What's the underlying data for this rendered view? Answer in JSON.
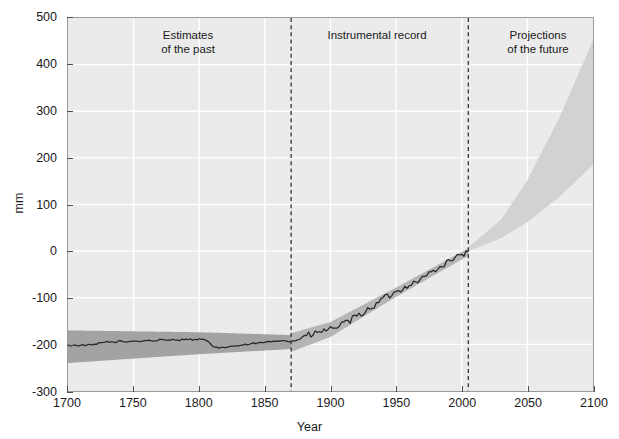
{
  "chart_data": {
    "type": "line",
    "title": "",
    "xlabel": "Year",
    "ylabel": "mm",
    "xlim": [
      1700,
      2100
    ],
    "ylim": [
      -300,
      500
    ],
    "xticks": [
      1700,
      1750,
      1800,
      1850,
      1900,
      1950,
      2000,
      2050,
      2100
    ],
    "yticks": [
      -300,
      -200,
      -100,
      0,
      100,
      200,
      300,
      400,
      500
    ],
    "grid": true,
    "legend_position": "none",
    "annotations": [
      {
        "text": "Estimates\nof the past",
        "x": 1785,
        "y": 455
      },
      {
        "text": "Instrumental record",
        "x": 1928,
        "y": 455
      },
      {
        "text": "Projections\nof the future",
        "x": 2058,
        "y": 455
      }
    ],
    "vertical_dividers": [
      {
        "x": 1870,
        "style": "dashed"
      },
      {
        "x": 2005,
        "style": "dashed"
      }
    ],
    "series": [
      {
        "name": "Reconstructed and observed sea level",
        "color": "#262626",
        "x": [
          1700,
          1710,
          1720,
          1725,
          1730,
          1735,
          1740,
          1745,
          1750,
          1755,
          1760,
          1765,
          1770,
          1775,
          1780,
          1785,
          1790,
          1795,
          1800,
          1805,
          1810,
          1815,
          1820,
          1825,
          1830,
          1835,
          1840,
          1845,
          1850,
          1855,
          1860,
          1865,
          1870,
          1875,
          1880,
          1885,
          1890,
          1895,
          1900,
          1905,
          1910,
          1915,
          1920,
          1925,
          1930,
          1935,
          1940,
          1945,
          1950,
          1955,
          1960,
          1965,
          1970,
          1975,
          1980,
          1985,
          1990,
          1995,
          2000,
          2005
        ],
        "values": [
          -202,
          -202,
          -201,
          -197,
          -194,
          -196,
          -193,
          -195,
          -192,
          -194,
          -191,
          -193,
          -190,
          -192,
          -189,
          -191,
          -188,
          -190,
          -189,
          -190,
          -204,
          -209,
          -206,
          -204,
          -203,
          -201,
          -199,
          -197,
          -196,
          -194,
          -192,
          -191,
          -196,
          -188,
          -183,
          -180,
          -176,
          -170,
          -168,
          -160,
          -158,
          -150,
          -140,
          -133,
          -122,
          -115,
          -100,
          -96,
          -88,
          -80,
          -72,
          -66,
          -58,
          -48,
          -40,
          -32,
          -22,
          -14,
          -8,
          -2
        ]
      }
    ],
    "bands": [
      {
        "name": "Uncertainty of past estimates",
        "color": "#a3a3a3",
        "opacity": 1,
        "x": [
          1700,
          1800,
          1870
        ],
        "lower": [
          -240,
          -221,
          -210
        ],
        "upper": [
          -170,
          -174,
          -180
        ]
      },
      {
        "name": "Instrumental record uncertainty",
        "color": "#b5b5b5",
        "opacity": 1,
        "x": [
          1870,
          1900,
          1950,
          2005
        ],
        "lower": [
          -216,
          -184,
          -98,
          -10
        ],
        "upper": [
          -176,
          -152,
          -78,
          6
        ]
      },
      {
        "name": "Projection range",
        "color": "#d2d2d2",
        "opacity": 1,
        "x": [
          2005,
          2030,
          2050,
          2075,
          2100
        ],
        "lower": [
          0,
          28,
          62,
          118,
          185
        ],
        "upper": [
          8,
          68,
          152,
          290,
          452
        ]
      }
    ]
  },
  "axes": {
    "y_tick_labels": [
      "500",
      "400",
      "300",
      "200",
      "100",
      "0",
      "-100",
      "-200",
      "-300"
    ],
    "x_tick_labels": [
      "1700",
      "1750",
      "1800",
      "1850",
      "1900",
      "1950",
      "2000",
      "2050",
      "2100"
    ],
    "x_title": "Year",
    "y_title": "mm"
  },
  "annotations": {
    "past_line1": "Estimates",
    "past_line2": "of the past",
    "instrumental": "Instrumental record",
    "future_line1": "Projections",
    "future_line2": "of the future"
  },
  "colors": {
    "plot_background": "#ebebeb",
    "gridline": "#ffffff",
    "axis_border": "#9a9a9a",
    "line": "#262626",
    "band_past": "#a3a3a3",
    "band_instrumental": "#b5b5b5",
    "band_projection": "#d2d2d2",
    "divider": "#333333",
    "text": "#1a1a1a"
  }
}
